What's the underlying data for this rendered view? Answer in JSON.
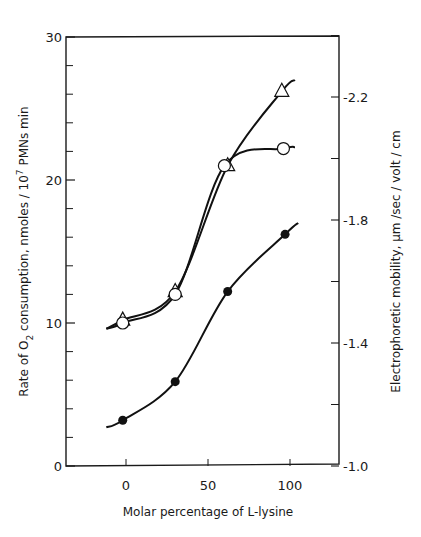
{
  "chart_data": {
    "type": "line",
    "title": "",
    "xlabel": "Molar percentage of L-lysine",
    "ylabel": "Rate of O2 consumption, nmoles / 10^7 PMNs min",
    "ylabel_right": "Electrophoretic mobility, μm /sec / volt / cm",
    "xlim": [
      -35,
      130
    ],
    "ylim": [
      0,
      30
    ],
    "ylim_right": [
      -1.0,
      -2.4
    ],
    "x_ticks": [
      0,
      50,
      100
    ],
    "x_tick_labels": [
      "0",
      "50",
      "100"
    ],
    "y_ticks": [
      0,
      10,
      20,
      30
    ],
    "y_tick_labels": [
      "0",
      "10",
      "20",
      "30"
    ],
    "y_minor_ticks": [
      2,
      4,
      6,
      8,
      12,
      14,
      16,
      18,
      22,
      24,
      26,
      28
    ],
    "y_right_ticks": [
      -1.0,
      -1.4,
      -1.8,
      -2.2
    ],
    "y_right_tick_labels": [
      "-1.0",
      "-1.4",
      "-1.8",
      "-2.2"
    ],
    "y_right_minor_ticks": [
      -1.2,
      -1.6,
      -2.0,
      -2.4
    ],
    "grid": false,
    "legend": null,
    "series": [
      {
        "name": "Triangles (open)",
        "marker": "triangle-open",
        "axis": "left",
        "x": [
          -2,
          30,
          62,
          95
        ],
        "values": [
          10.2,
          12.2,
          21.0,
          26.2
        ]
      },
      {
        "name": "Circles (open)",
        "marker": "circle-open",
        "axis": "left",
        "x": [
          -2,
          30,
          60,
          96
        ],
        "values": [
          10.0,
          12.0,
          21.0,
          22.2
        ]
      },
      {
        "name": "Filled circles",
        "marker": "circle-filled",
        "axis": "left",
        "x": [
          -2,
          30,
          62,
          97
        ],
        "values": [
          3.2,
          5.9,
          12.2,
          16.2
        ]
      }
    ]
  }
}
